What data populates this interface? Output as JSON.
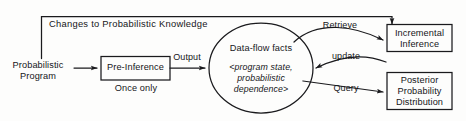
{
  "diagram": {
    "stroke_color": "#1a1a1d",
    "background_color": "#fdfdfc",
    "nodes": [
      {
        "id": "probabilistic-program",
        "shape": "text",
        "label_line1": "Probabilistic",
        "label_line2": "Program"
      },
      {
        "id": "pre-inference",
        "shape": "rectangle",
        "label": "Pre-Inference",
        "caption": "Once only"
      },
      {
        "id": "data-flow-facts",
        "shape": "ellipse",
        "label": "Data-flow facts",
        "detail_line1": "<program state,",
        "detail_line2": "probabilistic",
        "detail_line3": "dependence>"
      },
      {
        "id": "incremental-inference",
        "shape": "rectangle",
        "label_line1": "Incremental",
        "label_line2": "Inference"
      },
      {
        "id": "posterior-probability-distribution",
        "shape": "rectangle",
        "label_line1": "Posterior",
        "label_line2": "Probability",
        "label_line3": "Distribution"
      }
    ],
    "edges": [
      {
        "id": "program-to-preinference",
        "label": "",
        "from": "probabilistic-program",
        "to": "pre-inference"
      },
      {
        "id": "preinference-to-facts",
        "label": "Output",
        "from": "pre-inference",
        "to": "data-flow-facts"
      },
      {
        "id": "facts-to-incremental",
        "label": "Retrieve",
        "from": "data-flow-facts",
        "to": "incremental-inference"
      },
      {
        "id": "incremental-to-facts",
        "label": "update",
        "from": "incremental-inference",
        "to": "data-flow-facts"
      },
      {
        "id": "facts-to-posterior",
        "label": "Query",
        "from": "data-flow-facts",
        "to": "posterior-probability-distribution"
      },
      {
        "id": "feedback-loop",
        "label": "Changes to Probabilistic Knowledge",
        "from": "incremental-inference",
        "to": "pre-inference"
      }
    ]
  }
}
